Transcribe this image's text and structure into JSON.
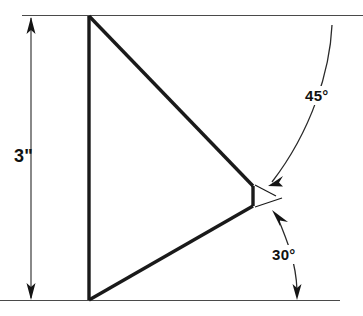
{
  "drawing": {
    "title": "Triangular wedge dimension drawing",
    "background_color": "#ffffff",
    "line_color": "#1a1a1a",
    "dimensions": {
      "height": {
        "value": "3\"",
        "orientation": "vertical",
        "side": "left"
      },
      "angle_upper": {
        "value": "45°",
        "position": "upper-right"
      },
      "angle_lower": {
        "value": "30°",
        "position": "lower-right"
      }
    },
    "shape": {
      "type": "polygon",
      "vertices": [
        {
          "name": "top-left",
          "x": 89,
          "y": 16
        },
        {
          "name": "apex-top",
          "x": 253,
          "y": 186
        },
        {
          "name": "apex-bottom",
          "x": 253,
          "y": 206
        },
        {
          "name": "bottom-left",
          "x": 89,
          "y": 300
        }
      ]
    }
  }
}
